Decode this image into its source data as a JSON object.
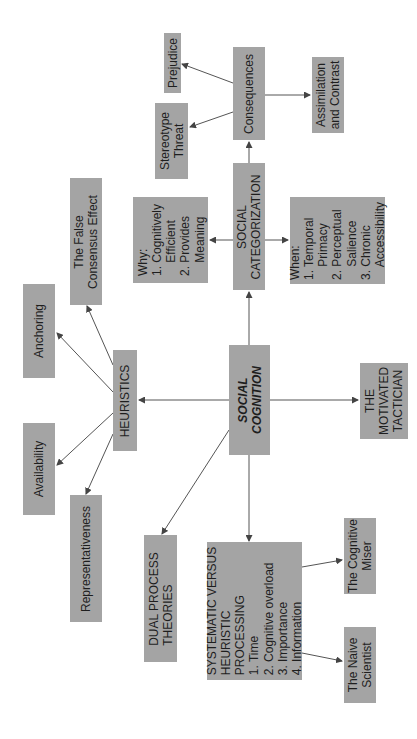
{
  "diagram": {
    "colors": {
      "node_fill": "#a4a4a4",
      "edge": "#444444",
      "text": "#1e1e1e",
      "background": "#ffffff"
    },
    "nodes": {
      "prejudice": "Prejudice",
      "consequences": "Consequences",
      "assimilation": "Assimilation\nand Contrast",
      "stereotype_threat": "Stereotype\nThreat",
      "social_categorization": "SOCIAL\nCATEGORIZATION",
      "why": "Why:\n1. Cognitively\n    Efficient\n2. Provides\n    Meaning",
      "when": "When:\n1. Temporal\n    Primacy\n2. Perceptual\n    Salience\n3. Chronic\n    Accessibility",
      "false_consensus": "The False\nConsensus Effect",
      "anchoring": "Anchoring",
      "heuristics": "HEURISTICS",
      "availability": "Availability",
      "representativeness": "Representativeness",
      "social_cognition": "SOCIAL\nCOGNITION",
      "motivated_tactician": "THE\nMOTIVATED\nTACTICIAN",
      "dual_process": "DUAL PROCESS\nTHEORIES",
      "systematic": "SYSTEMATIC VERSUS\nHEURISTIC\nPROCESSING\n1. Time\n2. Cognitive overload\n3. Importance\n4. Information",
      "cognitive_miser": "The Cognitive\nMiser",
      "naive_scientist": "The Naive\nScientist"
    },
    "edges": [
      [
        "social_cognition",
        "heuristics"
      ],
      [
        "social_cognition",
        "social_categorization"
      ],
      [
        "social_cognition",
        "motivated_tactician"
      ],
      [
        "social_cognition",
        "dual_process"
      ],
      [
        "social_cognition",
        "systematic"
      ],
      [
        "heuristics",
        "false_consensus"
      ],
      [
        "heuristics",
        "anchoring"
      ],
      [
        "heuristics",
        "availability"
      ],
      [
        "heuristics",
        "representativeness"
      ],
      [
        "social_categorization",
        "why"
      ],
      [
        "social_categorization",
        "when"
      ],
      [
        "social_categorization",
        "consequences"
      ],
      [
        "consequences",
        "prejudice"
      ],
      [
        "consequences",
        "stereotype_threat"
      ],
      [
        "consequences",
        "assimilation"
      ],
      [
        "systematic",
        "cognitive_miser"
      ],
      [
        "systematic",
        "naive_scientist"
      ]
    ]
  }
}
